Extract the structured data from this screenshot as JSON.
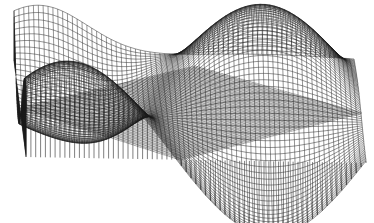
{
  "chart_data": {
    "type": "surface3d-wireframe",
    "title": "",
    "xlabel": "",
    "ylabel": "",
    "zlabel": "",
    "grid": false,
    "legend": null,
    "axes_visible": false,
    "function": "z = sin(pi*u) * cos(pi*v*0.9) * 1.0 + 0.35*u",
    "domain": {
      "u": [
        -1,
        1
      ],
      "v": [
        -1,
        1
      ]
    },
    "mesh": {
      "u_lines": 70,
      "v_lines": 70
    },
    "line_color": "#1a1a1a",
    "plane_color": "#555555",
    "background": "#ffffff",
    "projection": {
      "origin": [
        190,
        112
      ],
      "u_axis": [
        170,
        3
      ],
      "v_axis": [
        -6,
        -48
      ],
      "z_axis": [
        0,
        -78
      ]
    },
    "plane_vertices_px": {
      "left": [
        18,
        108
      ],
      "right": [
        362,
        113
      ],
      "back": [
        195,
        66
      ],
      "front": [
        180,
        160
      ]
    },
    "feature_points_px": {
      "peak": [
        245,
        15
      ],
      "back_left_ridge": [
        65,
        40
      ],
      "front_trough": [
        165,
        212
      ],
      "front_right_drop": [
        315,
        200
      ]
    }
  }
}
